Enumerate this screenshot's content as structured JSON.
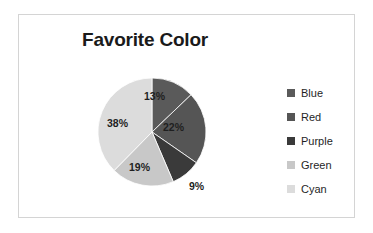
{
  "chart_data": {
    "type": "pie",
    "title": "Favorite Color",
    "categories": [
      "Blue",
      "Red",
      "Purple",
      "Green",
      "Cyan"
    ],
    "values": [
      13,
      22,
      9,
      19,
      38
    ],
    "data_labels": [
      "13%",
      "22%",
      "9%",
      "19%",
      "38%"
    ],
    "value_unit": "percent",
    "slice_colors": [
      "#5a5a5a",
      "#555555",
      "#3a3a3a",
      "#c8c8c8",
      "#dcdcdc"
    ],
    "legend_position": "right",
    "start_angle_deg": 0,
    "direction": "clockwise",
    "label_placement": [
      "inside",
      "inside",
      "outside",
      "inside",
      "inside"
    ],
    "xlabel": "",
    "ylabel": ""
  },
  "frame": {
    "border_color": "#d4d4d4",
    "background": "#ffffff"
  },
  "legend": {
    "items": [
      {
        "label": "Blue",
        "color": "#5a5a5a"
      },
      {
        "label": "Red",
        "color": "#555555"
      },
      {
        "label": "Purple",
        "color": "#3a3a3a"
      },
      {
        "label": "Green",
        "color": "#c8c8c8"
      },
      {
        "label": "Cyan",
        "color": "#dcdcdc"
      }
    ]
  },
  "labels": {
    "blue": "13%",
    "red": "22%",
    "purple": "9%",
    "green": "19%",
    "cyan": "38%"
  }
}
